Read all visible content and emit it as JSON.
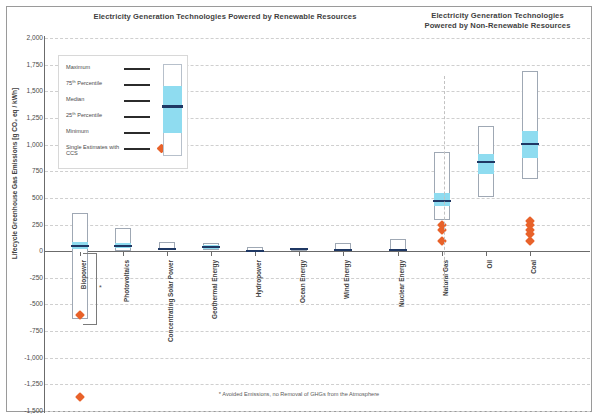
{
  "figure": {
    "headers": {
      "renewable": "Electricity Generation Technologies Powered by Renewable Resources",
      "non_renewable_line1": "Electricity Generation Technologies",
      "non_renewable_line2": "Powered by Non-Renewable Resources"
    },
    "footnote": "* Avoided Emissions, no Removal of GHGs from the Atmosphere",
    "bracket_marker": "*"
  },
  "legend": {
    "items": [
      {
        "label": "Maximum",
        "marker": "line"
      },
      {
        "label": "75ᵗʰ Percentile",
        "marker": "line"
      },
      {
        "label": "Median",
        "marker": "line"
      },
      {
        "label": "25ᵗʰ Percentile",
        "marker": "line"
      },
      {
        "label": "Minimum",
        "marker": "line"
      },
      {
        "label": "Single Estimates with CCS",
        "marker": "diamond"
      }
    ]
  },
  "colors": {
    "iqr_band": "#8fdcf0",
    "median_line": "#1f3864",
    "box_outline": "#9fa8b4",
    "ccs_marker": "#e8622a",
    "axis": "#6b6b6b",
    "grid": "#cfcfcf"
  },
  "chart_data": {
    "type": "box",
    "xlabel": "",
    "ylabel": "Lifecycle Greenhouse Gas Emissions [g CO₂ eq / kWh]",
    "ylim": [
      -1500,
      2000
    ],
    "ytick_labels": [
      "2,000",
      "1,750",
      "1,500",
      "1,250",
      "1,000",
      "750",
      "500",
      "250",
      "0",
      "-250",
      "-500",
      "-750",
      "-1,000",
      "-1,250",
      "-1,500"
    ],
    "ytick_values": [
      2000,
      1750,
      1500,
      1250,
      1000,
      750,
      500,
      250,
      0,
      -250,
      -500,
      -750,
      -1000,
      -1250,
      -1500
    ],
    "grid": true,
    "legend_position": "inside-top-left",
    "groups": [
      {
        "name": "Electricity Generation Technologies Powered by Renewable Resources",
        "categories": [
          "Biopower",
          "Photovoltaics",
          "Concentrating Solar Power",
          "Geothermal Energy",
          "Hydropower",
          "Ocean Energy",
          "Wind Energy"
        ]
      },
      {
        "name": "Electricity Generation Technologies Powered by Non-Renewable Resources",
        "categories": [
          "Nuclear Energy",
          "Natural Gas",
          "Oil",
          "Coal"
        ]
      }
    ],
    "categories": [
      "Biopower",
      "Photovoltaics",
      "Concentrating Solar Power",
      "Geothermal Energy",
      "Hydropower",
      "Ocean Energy",
      "Wind Energy",
      "Nuclear Energy",
      "Natural Gas",
      "Oil",
      "Coal"
    ],
    "boxes": [
      {
        "category": "Biopower",
        "min": -633,
        "q1": 18,
        "median": 52,
        "q3": 85,
        "max": 360,
        "ccs": [
          -600,
          -1368
        ]
      },
      {
        "category": "Photovoltaics",
        "min": 5,
        "q1": 29,
        "median": 46,
        "q3": 80,
        "max": 217,
        "ccs": []
      },
      {
        "category": "Concentrating Solar Power",
        "min": 7,
        "q1": 14,
        "median": 22,
        "q3": 32,
        "max": 89,
        "ccs": []
      },
      {
        "category": "Geothermal Energy",
        "min": 6,
        "q1": 20,
        "median": 37,
        "q3": 57,
        "max": 79,
        "ccs": []
      },
      {
        "category": "Hydropower",
        "min": 1,
        "q1": 3,
        "median": 4,
        "q3": 7,
        "max": 43,
        "ccs": []
      },
      {
        "category": "Ocean Energy",
        "min": 6,
        "q1": 8,
        "median": 17,
        "q3": 23,
        "max": 28,
        "ccs": []
      },
      {
        "category": "Wind Energy",
        "min": 2,
        "q1": 8,
        "median": 12,
        "q3": 20,
        "max": 81,
        "ccs": []
      },
      {
        "category": "Nuclear Energy",
        "min": 4,
        "q1": 8,
        "median": 13,
        "q3": 22,
        "max": 110,
        "ccs": []
      },
      {
        "category": "Natural Gas",
        "min": 290,
        "q1": 422,
        "median": 469,
        "q3": 548,
        "max": 930,
        "ccs": [
          92,
          200,
          245
        ]
      },
      {
        "category": "Oil",
        "min": 510,
        "q1": 722,
        "median": 840,
        "q3": 907,
        "max": 1170,
        "ccs": []
      },
      {
        "category": "Coal",
        "min": 675,
        "q1": 877,
        "median": 1001,
        "q3": 1130,
        "max": 1689,
        "ccs": [
          98,
          160,
          200,
          245,
          280
        ]
      }
    ]
  }
}
